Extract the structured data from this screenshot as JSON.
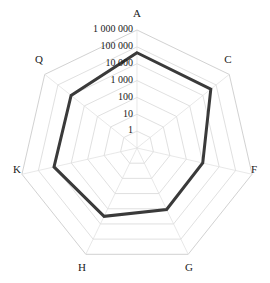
{
  "chart_data": {
    "type": "radar",
    "title": "",
    "subtitle": "",
    "xlabel": "",
    "ylabel": "",
    "scale": "log",
    "grid": true,
    "legend_position": "none",
    "categories": [
      "A",
      "C",
      "F",
      "G",
      "H",
      "K",
      "Q"
    ],
    "tick_labels": [
      "1 000 000",
      "100 000",
      "10 000",
      "1 000",
      "100",
      "10",
      "1"
    ],
    "tick_values": [
      1000000,
      100000,
      10000,
      1000,
      100,
      10,
      1
    ],
    "rlim": [
      1,
      1000000
    ],
    "series": [
      {
        "name": "series-1",
        "color": "#3a3a3a",
        "values": [
          300000,
          300000,
          10000,
          10000,
          30000,
          100000,
          100000
        ],
        "ring_positions": [
          5.65,
          5.6,
          4.0,
          4.05,
          4.5,
          5.05,
          5.0
        ]
      }
    ],
    "axis_label_positions": [
      {
        "label": "A",
        "x": 137,
        "y": 14
      },
      {
        "label": "C",
        "x": 228,
        "y": 60
      },
      {
        "label": "F",
        "x": 254,
        "y": 170
      },
      {
        "label": "G",
        "x": 189,
        "y": 268
      },
      {
        "label": "H",
        "x": 82,
        "y": 268
      },
      {
        "label": "K",
        "x": 17,
        "y": 170
      },
      {
        "label": "Q",
        "x": 39,
        "y": 60
      }
    ],
    "colors": {
      "data_line": "#3a3a3a",
      "grid": "#d8d8d8",
      "grid_outer": "#cccccc",
      "spoke": "#dedede",
      "text": "#1a1a1a",
      "background": "#ffffff"
    }
  },
  "geometry": {
    "center_x": 137,
    "center_y": 148,
    "outer_radius": 118,
    "ring_count": 7,
    "axis_count": 7,
    "start_angle_deg": -90
  }
}
